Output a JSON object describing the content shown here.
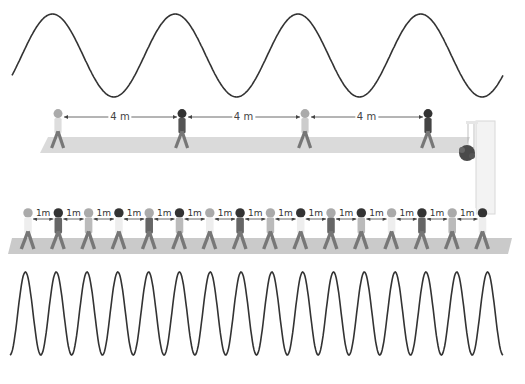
{
  "diagram": {
    "top_wave": {
      "cycles": 4,
      "stroke": "#333333"
    },
    "top_scene": {
      "walkers": 4,
      "spacing_labels": [
        "4 m",
        "4 m",
        "4 m"
      ],
      "walkway_color": "#d9d9d9",
      "object": "door-frame-with-plant"
    },
    "bottom_scene": {
      "walkers": 16,
      "spacing_labels": [
        "1m",
        "1m",
        "1m",
        "1m",
        "1m",
        "1m",
        "1m",
        "1m",
        "1m",
        "1m",
        "1m",
        "1m",
        "1m",
        "1m",
        "1m"
      ],
      "walkway_color": "#c8c8c8"
    },
    "bottom_wave": {
      "cycles": 16,
      "stroke": "#333333"
    }
  }
}
